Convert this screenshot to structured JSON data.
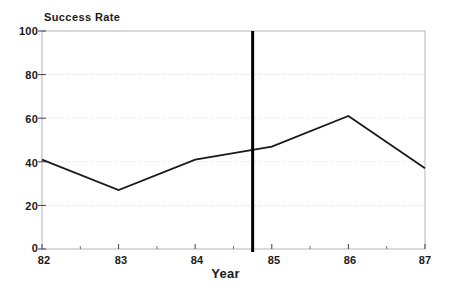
{
  "chart_data": {
    "type": "line",
    "title": "",
    "xlabel": "Year",
    "ylabel": "Success Rate",
    "x": [
      82,
      83,
      84,
      85,
      86,
      87
    ],
    "categories": [
      "82",
      "83",
      "84",
      "85",
      "86",
      "87"
    ],
    "values": [
      41,
      27,
      41,
      47,
      61,
      37
    ],
    "series": [
      {
        "name": "Success Rate",
        "values": [
          41,
          27,
          41,
          47,
          61,
          37
        ]
      }
    ],
    "xlim": [
      82,
      87
    ],
    "ylim": [
      0,
      100
    ],
    "x_ticks": [
      "82",
      "83",
      "84",
      "85",
      "86",
      "87"
    ],
    "y_ticks": [
      "0",
      "20",
      "40",
      "60",
      "80",
      "100"
    ],
    "y_tick_values": [
      0,
      20,
      40,
      60,
      80,
      100
    ],
    "grid": "horizontal-dotted",
    "legend": "none",
    "annotations": [
      {
        "type": "vertical-rule",
        "x": 84.75,
        "label": ""
      }
    ],
    "colors": {
      "line": "#1a1a1a",
      "frame": "#b0b0b0",
      "grid": "#d8d8d8",
      "marker_rule": "#000000",
      "background": "#ffffff"
    }
  },
  "axes": {
    "y_title": "Success Rate",
    "x_title": "Year",
    "y_labels": [
      "100",
      "80",
      "60",
      "40",
      "20",
      "0"
    ],
    "x_labels": [
      "82",
      "83",
      "84",
      "85",
      "86",
      "87"
    ]
  }
}
